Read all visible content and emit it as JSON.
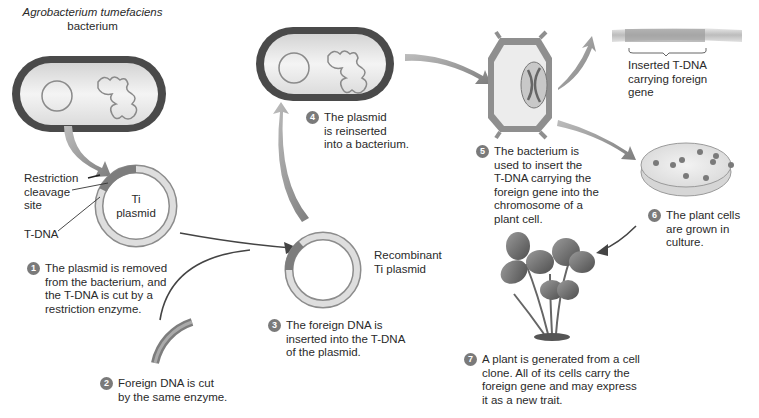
{
  "diagram": {
    "colors": {
      "background": "#ffffff",
      "cell_wall": "#4a4a4a",
      "cytoplasm": "#e6e6e6",
      "plasmid_ring": "#c8c8c8",
      "tdna_segment": "#7d7d7d",
      "arrow": "#9a9a9a",
      "badge": "#7a7a7a",
      "text": "#2a2a2a"
    },
    "labels": {
      "bacterium_species": "Agrobacterium tumefaciens",
      "bacterium_word": "bacterium",
      "restriction_site": "Restriction\ncleavage\nsite",
      "tdna": "T-DNA",
      "ti_plasmid": "Ti\nplasmid",
      "recombinant": "Recombinant\nTi plasmid",
      "inserted_tdna": "Inserted T-DNA\ncarrying foreign\ngene"
    },
    "steps": [
      {
        "number": "1",
        "text": "The plasmid is removed\nfrom the bacterium, and\nthe T-DNA is cut by a\nrestriction enzyme."
      },
      {
        "number": "2",
        "text": "Foreign DNA is cut\nby the same enzyme."
      },
      {
        "number": "3",
        "text": "The foreign DNA is\ninserted into the T-DNA\nof the plasmid."
      },
      {
        "number": "4",
        "text": "The plasmid\nis reinserted\ninto a bacterium."
      },
      {
        "number": "5",
        "text": "The bacterium is\nused to insert the\nT-DNA carrying the\nforeign gene into the\nchromosome of a\nplant cell."
      },
      {
        "number": "6",
        "text": "The plant cells\nare grown in\nculture."
      },
      {
        "number": "7",
        "text": "A plant is generated from a cell\nclone. All of its cells carry the\nforeign gene and may express\nit as a new trait."
      }
    ]
  }
}
